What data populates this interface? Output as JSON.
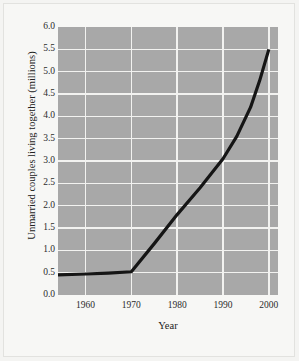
{
  "chart_data": {
    "type": "line",
    "title": "",
    "xlabel": "Year",
    "ylabel": "Unmarried couples living together (millions)",
    "xlim": [
      1954,
      2002
    ],
    "ylim": [
      0.0,
      6.0
    ],
    "grid": true,
    "legend": null,
    "xticks": [
      1960,
      1970,
      1980,
      1990,
      2000
    ],
    "xtick_labels": [
      "1960",
      "1970",
      "1980",
      "1990",
      "2000"
    ],
    "yticks": [
      0.0,
      0.5,
      1.0,
      1.5,
      2.0,
      2.5,
      3.0,
      3.5,
      4.0,
      4.5,
      5.0,
      5.5,
      6.0
    ],
    "ytick_labels": [
      "0.0",
      "0.5",
      "1.0",
      "1.5",
      "2.0",
      "2.5",
      "3.0",
      "3.5",
      "4.0",
      "4.5",
      "5.0",
      "5.5",
      "6.0"
    ],
    "series": [
      {
        "name": "Unmarried couples living together",
        "color": "#151515",
        "x": [
          1954,
          1960,
          1965,
          1970,
          1975,
          1980,
          1985,
          1990,
          1993,
          1996,
          1998,
          2000
        ],
        "values": [
          0.45,
          0.47,
          0.49,
          0.52,
          1.15,
          1.8,
          2.4,
          3.05,
          3.55,
          4.2,
          4.8,
          5.5
        ]
      }
    ]
  },
  "style": {
    "plot_background": "#a8a8a8",
    "grid_color": "#f2f2f0",
    "page_background": "#f7f7f5",
    "line_color": "#151515",
    "text_color": "#2b2b2b"
  }
}
